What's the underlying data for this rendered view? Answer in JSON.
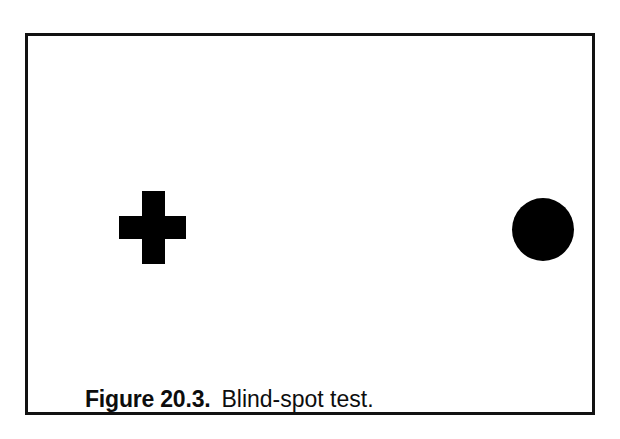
{
  "figure": {
    "frame": {
      "border_color": "#111111",
      "background_color": "#ffffff"
    },
    "stimuli": [
      {
        "name": "fixation-cross",
        "shape": "plus",
        "color": "#000000",
        "position": "left"
      },
      {
        "name": "blind-spot-dot",
        "shape": "circle",
        "color": "#000000",
        "position": "right"
      }
    ],
    "caption": {
      "label": "Figure 20.3.",
      "text": "Blind-spot test."
    }
  }
}
